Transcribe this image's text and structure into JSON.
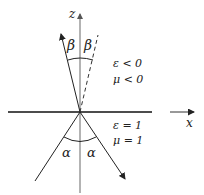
{
  "diagram": {
    "type": "refraction-negative-index",
    "axes": {
      "z_label": "z",
      "x_label": "x"
    },
    "upper_medium": {
      "epsilon": "ε < 0",
      "mu": "μ < 0"
    },
    "lower_medium": {
      "epsilon": "ε = 1",
      "mu": "μ = 1"
    },
    "angles": {
      "refracted_left": "β",
      "refracted_right": "β",
      "incident_left": "α",
      "incident_right": "α"
    },
    "colors": {
      "line": "#222222",
      "axis": "#888888",
      "interface": "#111111"
    }
  }
}
